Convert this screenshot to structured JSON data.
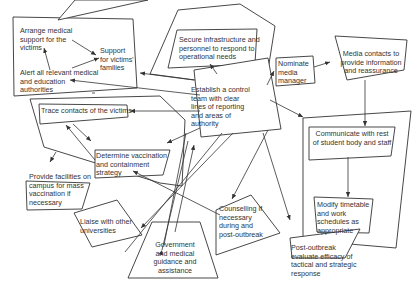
{
  "diagram": {
    "type": "flow-diagram",
    "colors": {
      "stroke": "#333333",
      "text": "#333333",
      "background": "#ffffff"
    },
    "nodes": {
      "arrange_medical": "Arrange medical\nsupport for the\nvictims",
      "support_families": "Support\nfor victims'\nfamilies",
      "alert_authorities": "Alert all relevant medical\nand education\nauthorities",
      "secure_infrastructure": "Secure infrastructure and\npersonnel to respond to\noperational needs",
      "nominate_media": "Nominate\nmedia\nmanager",
      "media_contacts": "Media contacts to\nprovide information\nand reassurance",
      "control_team": "Establish a control\nteam with clear\nlines of reporting\nand areas of\nauthority",
      "trace_contacts": "Trace contacts of the victims",
      "vaccination_strategy": "Determine vaccination\nand containment\nstrategy",
      "communicate": "Communicate with rest\nof student body and staff",
      "modify_timetable": "Modify timetable\nand work\nschedules as\nappropriate",
      "provide_facilities": "Provide facilities on\ncampus for mass\nvaccination if\nnecessary",
      "post_outbreak": "Post-outbreak\nevaluate efficacy of\ntactical and strategic\nresponse",
      "liaise": "Liaise with other\nuniversities",
      "counselling": "Counselling if\nnecessary\nduring and\npost-outbreak",
      "government": "Government\nand medical\nguidance and\nassistance"
    }
  }
}
